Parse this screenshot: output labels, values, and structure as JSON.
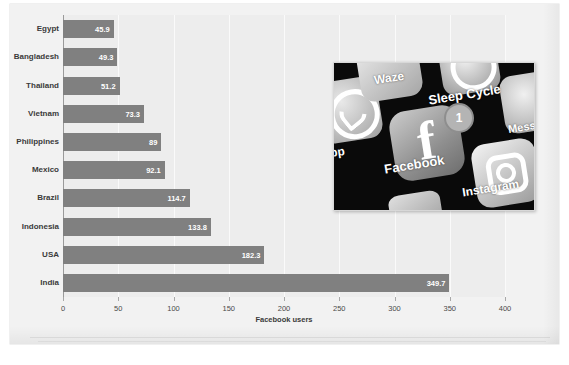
{
  "chart_data": {
    "type": "bar",
    "orientation": "horizontal",
    "title": "Facebook users, 2022",
    "xlabel": "Facebook users",
    "ylabel": "",
    "xlim": [
      0,
      400
    ],
    "xticks": [
      0,
      50,
      100,
      150,
      200,
      250,
      300,
      350,
      400
    ],
    "grid": true,
    "legend": null,
    "bar_color": "#808080",
    "plot_background": "#ededed",
    "categories": [
      "Egypt",
      "Bangladesh",
      "Thailand",
      "Vietnam",
      "Philippines",
      "Mexico",
      "Brazil",
      "Indonesia",
      "USA",
      "India"
    ],
    "values": [
      45.9,
      49.3,
      51.2,
      73.3,
      89,
      92.1,
      114.7,
      133.8,
      182.3,
      349.7
    ],
    "value_labels": [
      "45.9",
      "49.3",
      "51.2",
      "73.3",
      "89",
      "92.1",
      "114.7",
      "133.8",
      "182.3",
      "349.7"
    ]
  },
  "photo": {
    "name": "facebook-app-icon-photo",
    "app_labels": {
      "waze": "Waze",
      "sleep_cycle": "Sleep Cycle",
      "messenger": "Mess",
      "whatsapp": "pp",
      "facebook": "Facebook",
      "instagram": "Instagram"
    },
    "facebook_glyph": "f",
    "notification_badge": "1"
  }
}
